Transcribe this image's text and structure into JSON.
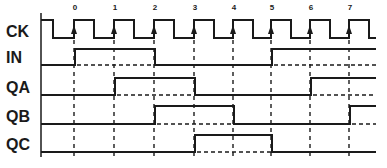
{
  "diagram": {
    "type": "timing-diagram",
    "color": "#1a1a1a",
    "background": "#ffffff",
    "clock_edges": [
      {
        "label": "0",
        "x": 74
      },
      {
        "label": "1",
        "x": 114
      },
      {
        "label": "2",
        "x": 154
      },
      {
        "label": "3",
        "x": 194
      },
      {
        "label": "4",
        "x": 233
      },
      {
        "label": "5",
        "x": 271
      },
      {
        "label": "6",
        "x": 310
      },
      {
        "label": "7",
        "x": 349
      }
    ],
    "axis_x": 41,
    "end_x": 376,
    "signals": [
      {
        "name": "CK",
        "high_y": 20,
        "low_y": 38,
        "label_y": 37
      },
      {
        "name": "IN",
        "high_y": 49,
        "low_y": 65,
        "label_y": 63,
        "high_intervals": [
          [
            0,
            2
          ],
          [
            5,
            "end"
          ]
        ]
      },
      {
        "name": "QA",
        "high_y": 78,
        "low_y": 95,
        "label_y": 93,
        "high_intervals": [
          [
            1,
            3
          ],
          [
            6,
            "end"
          ]
        ]
      },
      {
        "name": "QB",
        "high_y": 106,
        "low_y": 124,
        "label_y": 122,
        "high_intervals": [
          [
            2,
            4
          ],
          [
            7,
            "end"
          ]
        ]
      },
      {
        "name": "QC",
        "high_y": 135,
        "low_y": 152,
        "label_y": 150,
        "high_intervals": [
          [
            3,
            5
          ]
        ]
      }
    ]
  }
}
